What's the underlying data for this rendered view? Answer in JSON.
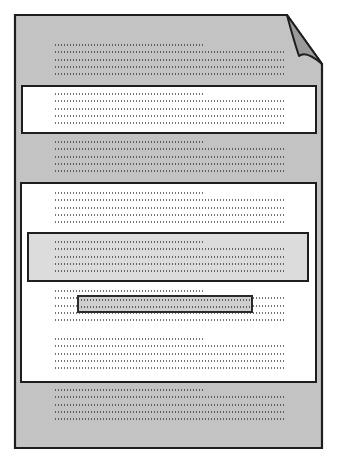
{
  "diagram": {
    "title": "Document page schematic with highlighted regions",
    "colors": {
      "page_fill": "#c3c3c3",
      "page_border": "#1e1e1e",
      "fold_fill": "#9a9a9a",
      "highlight_white": "#ffffff",
      "highlight_lightgrey": "#dcdcdc",
      "bar_fill": "#cfcfcf",
      "dot_color": "#5a5a5a"
    },
    "page": {
      "x": 15,
      "y": 15,
      "width": 307,
      "height": 433,
      "fold_corner": "top-right"
    },
    "regions": [
      {
        "id": "white-band-1",
        "type": "white",
        "x": 21,
        "y": 85,
        "width": 296,
        "height": 49
      },
      {
        "id": "white-box-large",
        "type": "white",
        "x": 20,
        "y": 182,
        "width": 297,
        "height": 201
      },
      {
        "id": "lightgrey-box",
        "type": "lightgrey",
        "x": 27,
        "y": 232,
        "width": 282,
        "height": 50
      },
      {
        "id": "highlight-bar",
        "type": "bar",
        "x": 77,
        "y": 295,
        "width": 176,
        "height": 18
      }
    ],
    "text_blocks": [
      {
        "id": "block-a",
        "y": 44,
        "surface": "grey"
      },
      {
        "id": "block-b",
        "y": 93,
        "surface": "white"
      },
      {
        "id": "block-c",
        "y": 141,
        "surface": "grey"
      },
      {
        "id": "block-d",
        "y": 192,
        "surface": "white"
      },
      {
        "id": "block-e",
        "y": 241,
        "surface": "lightgrey"
      },
      {
        "id": "block-f",
        "y": 290,
        "surface": "white"
      },
      {
        "id": "block-g",
        "y": 338,
        "surface": "white"
      },
      {
        "id": "block-h",
        "y": 389,
        "surface": "grey"
      }
    ],
    "lines_per_block": 5,
    "line_spacing": 7.3,
    "first_line_width": 151,
    "full_line_width": 231
  }
}
